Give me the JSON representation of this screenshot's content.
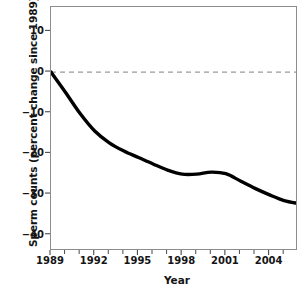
{
  "chart_data": {
    "type": "line",
    "title": "",
    "xlabel": "Year",
    "ylabel": "Sperm counts (percent change since 1989)",
    "xlim": [
      1989,
      2005.95
    ],
    "ylim": [
      -44,
      16
    ],
    "grid": false,
    "legend": "none",
    "line_color": "#000000",
    "zero_line": {
      "value": 0,
      "style": "dashed",
      "color": "#9a9a9a"
    },
    "xticks_major": [
      "1989",
      "1992",
      "1995",
      "1998",
      "2001",
      "2004"
    ],
    "xticks_major_values": [
      1989,
      1992,
      1995,
      1998,
      2001,
      2004
    ],
    "xticks_minor_values": [
      1990,
      1991,
      1993,
      1994,
      1996,
      1997,
      1999,
      2000,
      2002,
      2003,
      2005
    ],
    "yticks": [
      "10",
      "0",
      "−10",
      "−20",
      "−30",
      "−40"
    ],
    "yticks_values": [
      10,
      0,
      -10,
      -20,
      -30,
      -40
    ],
    "x": [
      1989,
      1990,
      1991,
      1992,
      1993,
      1994,
      1995,
      1996,
      1997,
      1998,
      1999,
      2000,
      2001,
      2002,
      2003,
      2004,
      2005,
      2005.95
    ],
    "values": [
      0,
      -5.0,
      -10.2,
      -14.5,
      -17.4,
      -19.4,
      -21.0,
      -22.6,
      -24.1,
      -25.1,
      -25.1,
      -24.6,
      -25.0,
      -26.8,
      -28.6,
      -30.2,
      -31.6,
      -32.3
    ],
    "series": [
      {
        "name": "Sperm count percent change",
        "values": [
          0,
          -5.0,
          -10.2,
          -14.5,
          -17.4,
          -19.4,
          -21.0,
          -22.6,
          -24.1,
          -25.1,
          -25.1,
          -24.6,
          -25.0,
          -26.8,
          -28.6,
          -30.2,
          -31.6,
          -32.3
        ]
      }
    ]
  },
  "axes": {
    "y_title": "Sperm counts (percent change since 1989)",
    "x_title": "Year"
  }
}
